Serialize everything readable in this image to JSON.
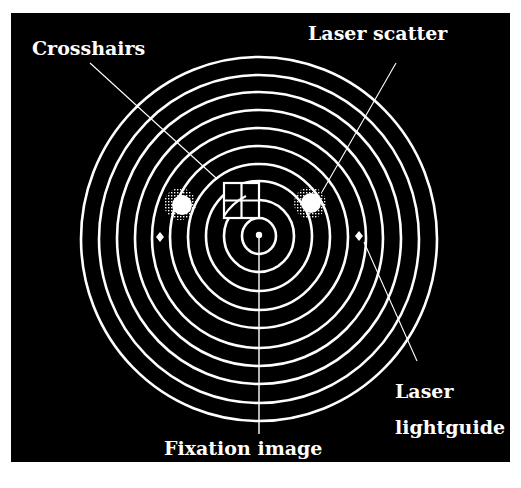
{
  "figure": {
    "background": "#000000",
    "page_background": "#ffffff",
    "foreground": "#ffffff",
    "labels": {
      "crosshairs": "Crosshairs",
      "laser_scatter": "Laser scatter",
      "laser_lightguide_line1": "Laser",
      "laser_lightguide_line2": "lightguide",
      "fixation_image": "Fixation image"
    },
    "rings": {
      "count": 10,
      "center": [
        259,
        235
      ],
      "radii": [
        17,
        35,
        53,
        71,
        89,
        107,
        124,
        142,
        160,
        178
      ]
    },
    "elements": [
      "concentric-rings",
      "crosshairs-grid",
      "laser-scatter-spot-left",
      "laser-scatter-spot-right",
      "lightguide-marker-left",
      "lightguide-marker-right",
      "fixation-center-dot",
      "fixation-line"
    ]
  }
}
